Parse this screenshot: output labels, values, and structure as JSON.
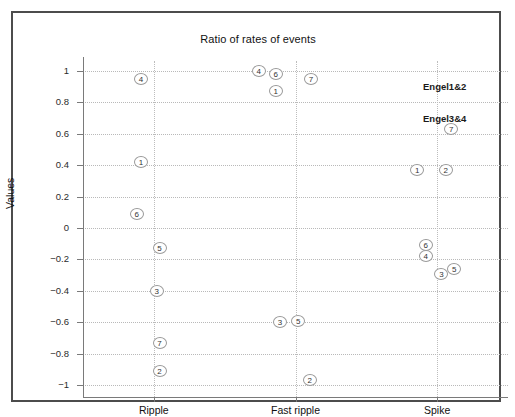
{
  "chart_data": {
    "type": "scatter",
    "title": "Ratio of  rates of events",
    "xlabel": "",
    "ylabel": "Values",
    "categories": [
      "Ripple",
      "Fast  ripple",
      "Spike"
    ],
    "ylim": [
      -1,
      1
    ],
    "yticks": [
      1,
      0.8,
      0.6,
      0.4,
      0.2,
      0,
      -0.2,
      -0.4,
      -0.6,
      -0.8,
      -1
    ],
    "ytick_labels": [
      "1",
      "0.8",
      "0.6",
      "0.4",
      "0.2",
      "0",
      "−0.2",
      "−0.4",
      "−0.6",
      "−0.8",
      "−1"
    ],
    "grid": true,
    "legend_position": "right",
    "legend": [
      "Engel1&2",
      "Engel3&4"
    ],
    "point_label_note": "each marker is an open circle containing a patient number",
    "points": [
      {
        "category": "Ripple",
        "x_offset": -0.09,
        "value": 0.95,
        "label": "4"
      },
      {
        "category": "Ripple",
        "x_offset": -0.09,
        "value": 0.42,
        "label": "1"
      },
      {
        "category": "Ripple",
        "x_offset": -0.12,
        "value": 0.09,
        "label": "6"
      },
      {
        "category": "Ripple",
        "x_offset": 0.04,
        "value": -0.13,
        "label": "5"
      },
      {
        "category": "Ripple",
        "x_offset": 0.02,
        "value": -0.4,
        "label": "3"
      },
      {
        "category": "Ripple",
        "x_offset": 0.04,
        "value": -0.73,
        "label": "7"
      },
      {
        "category": "Ripple",
        "x_offset": 0.04,
        "value": -0.91,
        "label": "2"
      },
      {
        "category": "Fast  ripple",
        "x_offset": -0.26,
        "value": 1.0,
        "label": "4"
      },
      {
        "category": "Fast  ripple",
        "x_offset": -0.14,
        "value": 0.98,
        "label": "6"
      },
      {
        "category": "Fast  ripple",
        "x_offset": -0.14,
        "value": 0.87,
        "label": "1"
      },
      {
        "category": "Fast  ripple",
        "x_offset": 0.11,
        "value": 0.95,
        "label": "7"
      },
      {
        "category": "Fast  ripple",
        "x_offset": -0.11,
        "value": -0.6,
        "label": "3"
      },
      {
        "category": "Fast  ripple",
        "x_offset": 0.02,
        "value": -0.59,
        "label": "5"
      },
      {
        "category": "Fast  ripple",
        "x_offset": 0.1,
        "value": -0.97,
        "label": "2"
      },
      {
        "category": "Spike",
        "x_offset": 0.1,
        "value": 0.63,
        "label": "7"
      },
      {
        "category": "Spike",
        "x_offset": -0.14,
        "value": 0.37,
        "label": "1"
      },
      {
        "category": "Spike",
        "x_offset": 0.06,
        "value": 0.37,
        "label": "2"
      },
      {
        "category": "Spike",
        "x_offset": -0.08,
        "value": -0.11,
        "label": "6"
      },
      {
        "category": "Spike",
        "x_offset": -0.08,
        "value": -0.18,
        "label": "4"
      },
      {
        "category": "Spike",
        "x_offset": 0.03,
        "value": -0.29,
        "label": "3"
      },
      {
        "category": "Spike",
        "x_offset": 0.12,
        "value": -0.26,
        "label": "5"
      }
    ]
  },
  "legend_items": [
    {
      "label": "Engel1&2",
      "top": 68
    },
    {
      "label": "Engel3&4",
      "top": 100
    }
  ],
  "colors": {
    "frame": "#4c4c4c",
    "axis": "#7a7a7a",
    "grid": "#b9b9b9",
    "marker_stroke": "#9a9a9a",
    "text": "#111111",
    "background": "#ffffff"
  }
}
